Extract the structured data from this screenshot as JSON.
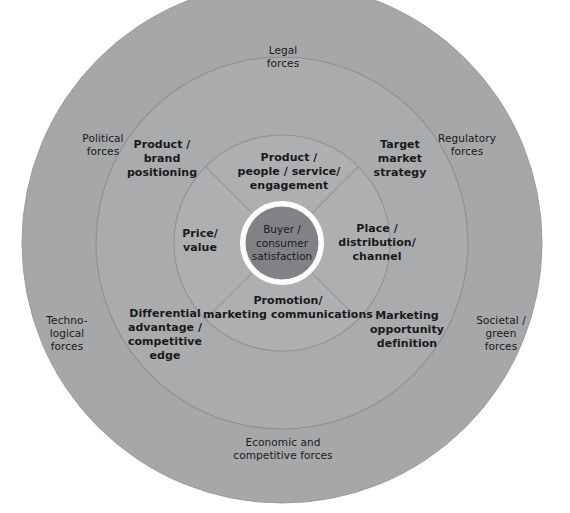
{
  "diagram": {
    "type": "concentric-rings",
    "colors": {
      "background": "#ffffff",
      "outer_ring_fill": "#a5a7a9",
      "middle_ring_fill": "#a9abad",
      "inner_ring_fill": "#adafb1",
      "core_fill": "#808285",
      "core_stroke": "#ffffff",
      "ring_stroke": "#8e9093",
      "divider_stroke": "#939598",
      "text": "#1a1a1a"
    },
    "geometry": {
      "center_x": 282,
      "center_y": 243,
      "outer_radius": 260,
      "middle_radius": 186,
      "inner_radius": 108,
      "core_radius": 37
    }
  },
  "core": {
    "label": "Buyer /\nconsumer\nsatisfaction"
  },
  "inner_ring": {
    "name": "marketing-mix-ring",
    "segments": [
      {
        "id": "top",
        "label": "Product /\npeople / service/\nengagement"
      },
      {
        "id": "left",
        "label": "Price/\nvalue"
      },
      {
        "id": "right",
        "label": "Place /\ndistribution/\nchannel"
      },
      {
        "id": "bottom",
        "label": "Promotion/\nmarketing communications"
      }
    ]
  },
  "middle_ring": {
    "name": "marketing-strategy-ring",
    "segments": [
      {
        "id": "top-left",
        "label": "Product /\nbrand\npositioning"
      },
      {
        "id": "top-right",
        "label": "Target\nmarket\nstrategy"
      },
      {
        "id": "bottom-left",
        "label": "Differential\nadvantage /\ncompetitive\nedge"
      },
      {
        "id": "bottom-right",
        "label": "Marketing\nopportunity\ndefinition"
      }
    ]
  },
  "outer_ring": {
    "name": "environmental-forces-ring",
    "segments": [
      {
        "id": "top",
        "label": "Legal\nforces"
      },
      {
        "id": "upper-left",
        "label": "Political\nforces"
      },
      {
        "id": "upper-right",
        "label": "Regulatory\nforces"
      },
      {
        "id": "lower-left",
        "label": "Techno-\nlogical\nforces"
      },
      {
        "id": "lower-right",
        "label": "Societal /\ngreen\nforces"
      },
      {
        "id": "bottom",
        "label": "Economic and\ncompetitive forces"
      }
    ]
  }
}
